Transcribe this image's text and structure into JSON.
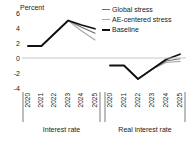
{
  "chart_data": {
    "type": "line",
    "title": "",
    "ylabel": "Percent",
    "xlabel": "",
    "ylim": [
      -4,
      6
    ],
    "yticks": [
      6,
      4,
      2,
      0,
      -2,
      -4
    ],
    "ytick_labels": [
      "6",
      "4",
      "2",
      "0",
      "-2",
      "-4"
    ],
    "grid": false,
    "zero_line": true,
    "legend_position": "top-right",
    "legend": [
      {
        "name": "Global stress",
        "color": "#6e6e6e"
      },
      {
        "name": "AE-centered stress",
        "color": "#a8a8a8"
      },
      {
        "name": "Baseline",
        "color": "#111111"
      }
    ],
    "panels": [
      {
        "name": "Interest rate",
        "x": [
          "2020",
          "2021",
          "2022",
          "2023",
          "2024",
          "2025"
        ],
        "series": [
          {
            "name": "Baseline",
            "color": "#111111",
            "width": 1.8,
            "values": [
              1.6,
              1.6,
              3.3,
              5.0,
              4.4,
              3.9
            ]
          },
          {
            "name": "Global stress",
            "color": "#6e6e6e",
            "width": 1.1,
            "values": [
              1.6,
              1.6,
              3.3,
              5.0,
              4.1,
              3.3
            ]
          },
          {
            "name": "AE-centered stress",
            "color": "#a8a8a8",
            "width": 1.1,
            "values": [
              1.6,
              1.6,
              3.3,
              5.0,
              3.6,
              2.4
            ]
          }
        ]
      },
      {
        "name": "Real interest rate",
        "x": [
          "2020",
          "2021",
          "2022",
          "2023",
          "2024",
          "2025"
        ],
        "series": [
          {
            "name": "Baseline",
            "color": "#111111",
            "width": 1.8,
            "values": [
              -1.0,
              -1.0,
              -2.8,
              -1.5,
              -0.2,
              0.5
            ]
          },
          {
            "name": "Global stress",
            "color": "#6e6e6e",
            "width": 1.1,
            "values": [
              -1.0,
              -1.0,
              -2.8,
              -1.5,
              -0.4,
              -0.1
            ]
          },
          {
            "name": "AE-centered stress",
            "color": "#a8a8a8",
            "width": 1.1,
            "values": [
              -1.0,
              -1.0,
              -2.8,
              -1.5,
              -0.6,
              -0.45
            ]
          }
        ]
      }
    ]
  }
}
